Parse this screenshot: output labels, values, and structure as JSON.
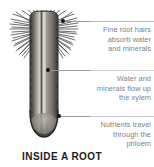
{
  "figure": {
    "caption": "INSIDE A ROOT",
    "background_color": "#ffffff",
    "text_color": "#808080",
    "caption_color": "#1c1c1c",
    "rule_color": "#c9c9c9",
    "dot_color": "#111111"
  },
  "illustration": {
    "subject": "root-cross-section",
    "description": "Longitudinal view of a plant root with root hairs and internal vascular tissue",
    "body_color": "#8e8a84",
    "highlight_color": "#d8d4cc",
    "outline_color": "#2b2b2b"
  },
  "callouts": [
    {
      "id": "root-hairs",
      "text": "Fine root hairs absorb water and minerals",
      "lines": [
        "Fine root hairs",
        "absorb water",
        "and minerals"
      ]
    },
    {
      "id": "xylem",
      "text": "Water and minerals flow up the xylem",
      "lines": [
        "Water and",
        "minerals flow up",
        "the xylem"
      ]
    },
    {
      "id": "phloem",
      "text": "Nutrients travel through the phloem",
      "lines": [
        "Nutrients travel",
        "through the",
        "phloem"
      ]
    }
  ]
}
